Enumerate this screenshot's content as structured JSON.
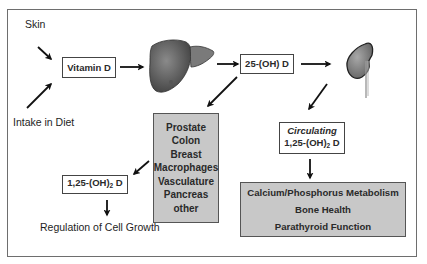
{
  "diagram": {
    "title": "",
    "sources": {
      "skin": "Skin",
      "diet": "Intake in Diet"
    },
    "nodes": {
      "vitamin_d": "Vitamin D",
      "liver": "liver",
      "hydroxy_25": "25-(OH) D",
      "kidney": "kidney",
      "tissues": [
        "Prostate",
        "Colon",
        "Breast",
        "Macrophages",
        "Vasculature",
        "Pancreas",
        "other"
      ],
      "local_125": {
        "prefix": "1,25-(OH)",
        "sub": "2",
        "suffix": " D"
      },
      "circulating": {
        "label": "Circulating",
        "prefix": "1,25-(OH)",
        "sub": "2",
        "suffix": " D"
      },
      "systemic_effects": [
        "Calcium/Phosphorus Metabolism",
        "Bone Health",
        "Parathyroid Function"
      ],
      "cell_growth": "Regulation of Cell Growth"
    },
    "colors": {
      "gray_box": "#c8c8c8",
      "organ": "#5a5a5a",
      "arrow": "#111111",
      "frame": "#6e6e6e"
    }
  }
}
